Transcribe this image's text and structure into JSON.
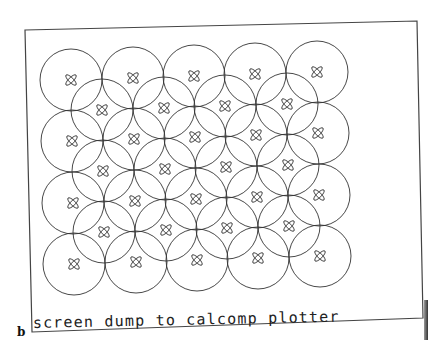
{
  "figure": {
    "label": "b",
    "caption": "screen dump to calcomp plotter"
  },
  "plot": {
    "frame": {
      "corners": [
        [
          25,
          30
        ],
        [
          417,
          21
        ],
        [
          423,
          318
        ],
        [
          32,
          332
        ]
      ]
    },
    "circle_radius": 31,
    "line_color": "#333333",
    "rows_main": [
      {
        "y": 80,
        "x": [
          71,
          133,
          194,
          255,
          317
        ],
        "dy": -2
      },
      {
        "y": 141,
        "x": [
          72,
          134,
          195,
          256,
          318
        ],
        "dy": -2
      },
      {
        "y": 203,
        "x": [
          73,
          135,
          196,
          257,
          319
        ],
        "dy": -2
      },
      {
        "y": 264,
        "x": [
          74,
          136,
          197,
          258,
          320
        ],
        "dy": -2
      }
    ],
    "rows_offset": [
      {
        "y": 110,
        "x": [
          102,
          164,
          225,
          287
        ],
        "dy": -2
      },
      {
        "y": 171,
        "x": [
          103,
          165,
          226,
          288
        ],
        "dy": -2
      },
      {
        "y": 232,
        "x": [
          104,
          166,
          227,
          289
        ],
        "dy": -2
      }
    ]
  }
}
